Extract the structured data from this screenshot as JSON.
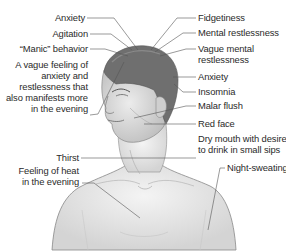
{
  "figure": {
    "line_color": "#555555",
    "text_color": "#2a2a2a",
    "skin_color": "#e6e6e6",
    "hair_color": "#6e6e6e"
  },
  "labels_left": [
    {
      "text": "Anxiety",
      "target": "top of head"
    },
    {
      "text": "Agitation",
      "target": "top of head"
    },
    {
      "text": "“Manic” behavior",
      "target": "top of head"
    },
    {
      "text": "A vague feeling of anxiety and restlessness that also manifests more in the evening",
      "lines": [
        "A vague feeling of",
        "anxiety and",
        "restlessness that",
        "also manifests more",
        "in the evening"
      ],
      "target": "forehead"
    },
    {
      "text": "Thirst",
      "target": "mouth"
    },
    {
      "text": "Feeling of heat in the evening",
      "lines": [
        "Feeling of heat",
        "in the evening"
      ],
      "target": "chest"
    }
  ],
  "labels_right": [
    {
      "text": "Fidgetiness",
      "target": "top of head"
    },
    {
      "text": "Mental restlessness",
      "target": "top of head"
    },
    {
      "text": "Vague mental restlessness",
      "lines": [
        "Vague mental",
        "restlessness"
      ],
      "target": "top of head"
    },
    {
      "text": "Anxiety",
      "target": "back of head"
    },
    {
      "text": "Insomnia",
      "target": "back of head"
    },
    {
      "text": "Malar flush",
      "target": "cheek"
    },
    {
      "text": "Red face",
      "target": "face"
    },
    {
      "text": "Dry mouth with desire to drink in small sips",
      "lines": [
        "Dry mouth with desire",
        "to drink in small sips"
      ],
      "target": "mouth"
    },
    {
      "text": "Night-sweating",
      "target": "chest"
    }
  ]
}
